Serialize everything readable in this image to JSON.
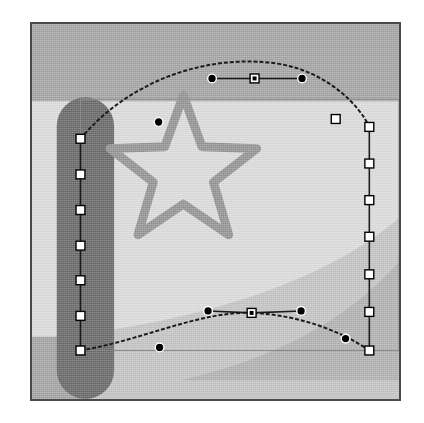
{
  "app": {
    "title": "Envelope Mesh Warp Canvas",
    "tool": "mesh-warp-tool",
    "document_background": "#ffffff"
  },
  "canvas": {
    "name": "artboard",
    "x": 30,
    "y": 22,
    "width": 371,
    "height": 379,
    "border_color": "#4a4a4a",
    "background_color": "#a3a3a3"
  },
  "palette": {
    "outer_page": "#ffffff",
    "canvas_border": "#4a4a4a",
    "background_gray": "#a3a3a3",
    "band_light": "#d9d9d9",
    "band_medium": "#c2c2c2",
    "band_mid_dark": "#b0b0b0",
    "dark_bar": "#6d6d6d",
    "star_stroke": "#949494",
    "path_stroke": "#1a1a1a",
    "anchor_fill": "#ffffff",
    "anchor_stroke": "#000000",
    "handle_fill": "#000000",
    "bbox_line": "#8d8d8d"
  },
  "artwork": {
    "shapes": [
      {
        "name": "light-swoosh-band",
        "type": "curved-band",
        "fill": "#d9d9d9",
        "path": "M 0,78 L 371,78 L 371,200 C 300,262 180,300 58,316 L 0,316 Z"
      },
      {
        "name": "medium-swoosh-band",
        "type": "curved-band",
        "fill": "#c2c2c2",
        "path": "M 371,196 C 300,258 180,296 58,312 L 58,379 L 371,379 Z"
      },
      {
        "name": "mid-dark-swoosh-band",
        "type": "curved-band",
        "fill": "#b0b0b0",
        "path": "M 371,240 C 320,300 240,340 150,360 L 371,360 Z"
      },
      {
        "name": "dark-rounded-bar",
        "type": "rounded-bar",
        "fill": "#6d6d6d",
        "x": 25,
        "y": 74,
        "width": 58,
        "height": 305,
        "corner_radius": 29
      },
      {
        "name": "star-outline",
        "type": "star",
        "points": 5,
        "stroke": "#949494",
        "stroke_width": 9,
        "fill": "none",
        "center_x": 153,
        "center_y": 150,
        "outer_radius": 78,
        "inner_radius": 32
      }
    ]
  },
  "bounding_box": {
    "name": "original-bounds-rect",
    "stroke": "#8d8d8d",
    "x": 49,
    "y": 76,
    "width": 322,
    "height": 254
  },
  "mesh": {
    "name": "envelope-mesh",
    "edges": [
      {
        "name": "top-edge-curve",
        "path": "M 49,116 C 100,55 180,30 248,40 C 300,48 332,84 341,104",
        "style": "dashed"
      },
      {
        "name": "right-edge-line",
        "path": "M 341,104 L 341,330",
        "style": "solid"
      },
      {
        "name": "bottom-edge-curve",
        "path": "M 49,330 C 110,320 170,290 222,292 C 272,294 315,312 341,330",
        "style": "dashed"
      },
      {
        "name": "left-edge-line",
        "path": "M 49,116 L 49,330",
        "style": "solid"
      }
    ],
    "anchors": {
      "left_edge": [
        {
          "x": 49,
          "y": 116,
          "shape": "square"
        },
        {
          "x": 49,
          "y": 152,
          "shape": "square"
        },
        {
          "x": 49,
          "y": 188,
          "shape": "square"
        },
        {
          "x": 49,
          "y": 224,
          "shape": "square"
        },
        {
          "x": 49,
          "y": 259,
          "shape": "square"
        },
        {
          "x": 49,
          "y": 295,
          "shape": "square"
        },
        {
          "x": 49,
          "y": 330,
          "shape": "square"
        }
      ],
      "right_edge": [
        {
          "x": 341,
          "y": 104,
          "shape": "square"
        },
        {
          "x": 341,
          "y": 141,
          "shape": "square"
        },
        {
          "x": 341,
          "y": 178,
          "shape": "square"
        },
        {
          "x": 341,
          "y": 215,
          "shape": "square"
        },
        {
          "x": 341,
          "y": 253,
          "shape": "square"
        },
        {
          "x": 341,
          "y": 291,
          "shape": "square"
        },
        {
          "x": 341,
          "y": 330,
          "shape": "square"
        }
      ],
      "top_curve": [
        {
          "x": 128,
          "y": 99,
          "shape": "circle"
        },
        {
          "x": 225,
          "y": 55,
          "shape": "square",
          "selected": true
        },
        {
          "x": 307,
          "y": 96,
          "shape": "square"
        }
      ],
      "bottom_curve": [
        {
          "x": 129,
          "y": 327,
          "shape": "circle"
        },
        {
          "x": 222,
          "y": 292,
          "shape": "square",
          "selected": true
        },
        {
          "x": 317,
          "y": 318,
          "shape": "circle"
        }
      ]
    },
    "handles": [
      {
        "name": "top-anchor-handle-left",
        "from_x": 225,
        "from_y": 55,
        "to_x": 182,
        "to_y": 55,
        "endpoint_shape": "circle"
      },
      {
        "name": "top-anchor-handle-right",
        "from_x": 225,
        "from_y": 55,
        "to_x": 273,
        "to_y": 55,
        "endpoint_shape": "circle"
      },
      {
        "name": "bottom-anchor-handle-left",
        "from_x": 222,
        "from_y": 292,
        "to_x": 178,
        "to_y": 290,
        "endpoint_shape": "circle"
      },
      {
        "name": "bottom-anchor-handle-right",
        "from_x": 222,
        "from_y": 292,
        "to_x": 272,
        "to_y": 290,
        "endpoint_shape": "circle"
      }
    ]
  }
}
